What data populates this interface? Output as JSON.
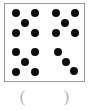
{
  "exercise": {
    "type": "count-the-dots",
    "total_dots": 18,
    "answer_value": "",
    "answer_open_paren": "(",
    "answer_close_paren": ")"
  },
  "colors": {
    "dot": "#0d0d0d",
    "box_border": "#9a9a9a",
    "box_fill": "#ffffff",
    "paren": "#b4b4b4",
    "page_background": "#ffffff"
  },
  "chart_data": {
    "type": "scatter",
    "title": "",
    "xlabel": "",
    "ylabel": "",
    "xlim": [
      0,
      81
    ],
    "ylim": [
      0,
      79
    ],
    "grid": false,
    "legend": null,
    "marker": "filled-circle",
    "marker_size_px": 8,
    "total_points": 18,
    "groups": [
      {
        "name": "top-left-group",
        "count": 5,
        "pattern": "quincunx",
        "points": [
          {
            "x": 11,
            "y": 9
          },
          {
            "x": 30,
            "y": 9
          },
          {
            "x": 20,
            "y": 19
          },
          {
            "x": 11,
            "y": 29
          },
          {
            "x": 30,
            "y": 29
          }
        ]
      },
      {
        "name": "top-right-group",
        "count": 5,
        "pattern": "quincunx",
        "points": [
          {
            "x": 51,
            "y": 9
          },
          {
            "x": 70,
            "y": 9
          },
          {
            "x": 60,
            "y": 19
          },
          {
            "x": 51,
            "y": 29
          },
          {
            "x": 70,
            "y": 29
          }
        ]
      },
      {
        "name": "bottom-left-group",
        "count": 5,
        "pattern": "quincunx",
        "points": [
          {
            "x": 11,
            "y": 48
          },
          {
            "x": 30,
            "y": 48
          },
          {
            "x": 20,
            "y": 58
          },
          {
            "x": 11,
            "y": 68
          },
          {
            "x": 30,
            "y": 68
          }
        ]
      },
      {
        "name": "bottom-right-group",
        "count": 3,
        "pattern": "descending-diagonal",
        "points": [
          {
            "x": 53,
            "y": 48
          },
          {
            "x": 61,
            "y": 58
          },
          {
            "x": 69,
            "y": 67
          }
        ]
      }
    ]
  }
}
